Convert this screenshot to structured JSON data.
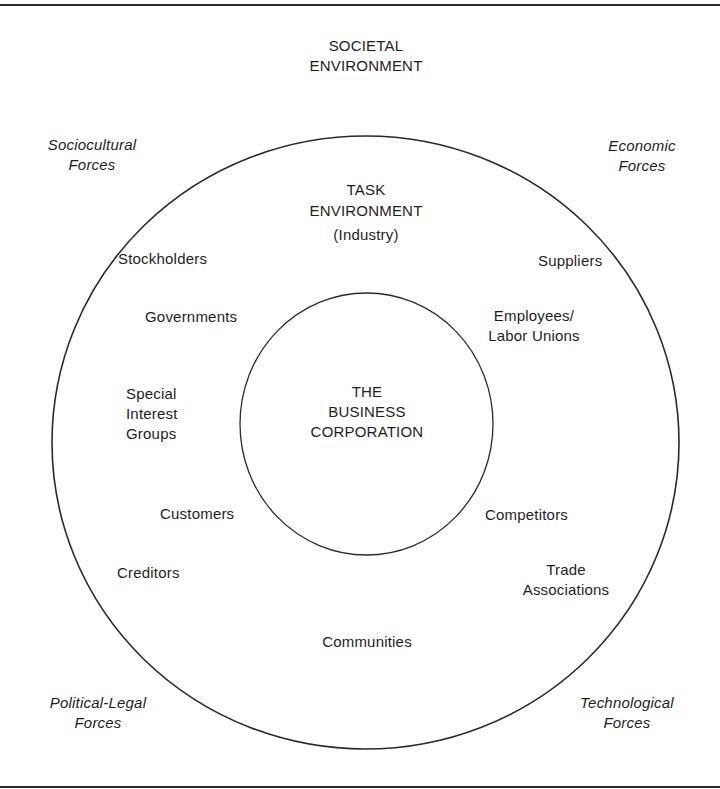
{
  "diagram": {
    "societal_environment": {
      "lines": [
        "SOCIETAL",
        "ENVIRONMENT"
      ]
    },
    "task_environment": {
      "lines": [
        "TASK",
        "ENVIRONMENT",
        "(Industry)"
      ]
    },
    "core": {
      "lines": [
        "THE",
        "BUSINESS",
        "CORPORATION"
      ]
    },
    "forces": {
      "sociocultural": {
        "lines": [
          "Sociocultural",
          "Forces"
        ]
      },
      "economic": {
        "lines": [
          "Economic",
          "Forces"
        ]
      },
      "political_legal": {
        "lines": [
          "Political-Legal",
          "Forces"
        ]
      },
      "technological": {
        "lines": [
          "Technological",
          "Forces"
        ]
      }
    },
    "stakeholders": {
      "stockholders": "Stockholders",
      "suppliers": "Suppliers",
      "governments": "Governments",
      "employees": {
        "lines": [
          "Employees/",
          "Labor Unions"
        ]
      },
      "special_interest": {
        "lines": [
          "Special",
          "Interest",
          "Groups"
        ]
      },
      "customers": "Customers",
      "competitors": "Competitors",
      "creditors": "Creditors",
      "trade_associations": {
        "lines": [
          "Trade",
          "Associations"
        ]
      },
      "communities": "Communities"
    },
    "colors": {
      "line": "#2a2a2a",
      "text": "#1e1e1e",
      "background": "#ffffff"
    }
  }
}
